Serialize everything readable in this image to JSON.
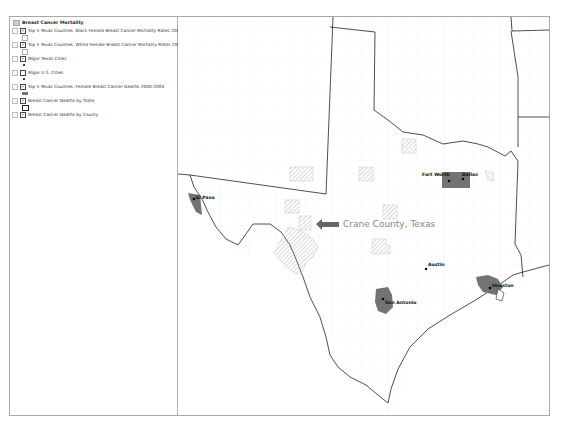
{
  "toc": {
    "title": "Breast Cancer Mortality",
    "layers": [
      {
        "label": "Top 5 Texas Counties, Black Female Breast Cancer Mortality Rates 2000-2004",
        "checked": true,
        "symbol": "hatch-box"
      },
      {
        "label": "Top 5 Texas Counties, White Female Breast Cancer Mortality Rates 2000-2004",
        "checked": true,
        "symbol": "hatch-box"
      },
      {
        "label": "Major Texas Cities",
        "checked": true,
        "symbol": "dot"
      },
      {
        "label": "Major U.S. Cities",
        "checked": false,
        "symbol": "dot"
      },
      {
        "label": "Top 5 Texas Counties, Female Breast Cancer Deaths 2000-2004",
        "checked": true,
        "symbol": "gray-fill"
      },
      {
        "label": "Breast Cancer Deaths by State",
        "checked": true,
        "symbol": "outline-box"
      },
      {
        "label": "Breast Cancer Deaths by County",
        "checked": true,
        "symbol": "none"
      }
    ]
  },
  "map": {
    "cities": [
      {
        "name": "El Paso"
      },
      {
        "name": "Fort Worth"
      },
      {
        "name": "Dallas"
      },
      {
        "name": "Austin"
      },
      {
        "name": "San Antonio"
      },
      {
        "name": "Houston"
      }
    ],
    "annotation": "Crane County, Texas",
    "colors": {
      "county_fill": "#737373",
      "hatch": "#b8b8b8",
      "state_line": "#222222",
      "county_line": "#e6e6e6"
    }
  }
}
